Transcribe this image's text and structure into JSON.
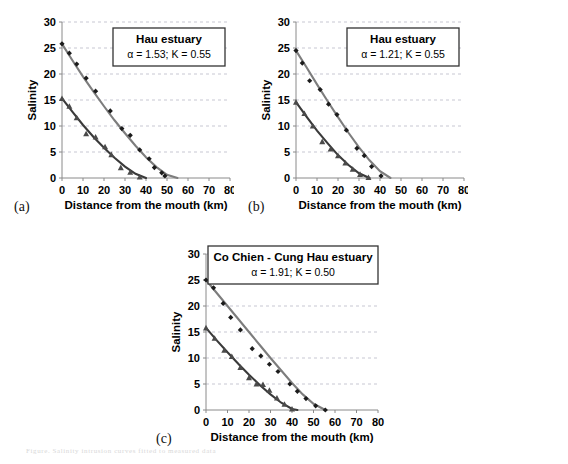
{
  "figure": {
    "background": "#ffffff",
    "caption_faint": "Figure. Salinity intrusion curves fitted to measured data",
    "colors": {
      "surface_curve": "#7d7d7d",
      "bottom_curve": "#3a3a3a",
      "grid": "#b9b9c6",
      "axis": "#8a8a8a",
      "marker_diamond": "#1c1c1c",
      "marker_triangle": "#4a4a4a"
    }
  },
  "panels": [
    {
      "letter": "(a)",
      "legend_title": "Hau estuary",
      "legend_sub": "α = 1.53; K = 0.55"
    },
    {
      "letter": "(b)",
      "legend_title": "Hau estuary",
      "legend_sub": "α = 1.21; K = 0.55"
    },
    {
      "letter": "(c)",
      "legend_title": "Co Chien - Cung Hau estuary",
      "legend_sub": "α = 1.91; K = 0.50"
    }
  ],
  "chart_data": [
    {
      "id": "panel-a",
      "type": "scatter",
      "title": "Hau estuary",
      "annotation": "α = 1.53; K = 0.55",
      "xlabel": "Distance from the mouth (km)",
      "ylabel": "Salinity",
      "xlim": [
        0,
        80
      ],
      "ylim": [
        0,
        30
      ],
      "xticks": [
        0,
        10,
        20,
        30,
        40,
        50,
        60,
        70,
        80
      ],
      "yticks": [
        0,
        5,
        10,
        15,
        20,
        25,
        30
      ],
      "grid": "horizontal-dashed",
      "legend_position": "top-right-box",
      "series": [
        {
          "name": "Surface salinity (measured)",
          "marker": "diamond",
          "color": "#1c1c1c",
          "x": [
            0,
            3.5,
            7,
            11.5,
            16,
            23,
            28.5,
            32.5,
            37,
            41.5,
            44,
            47.5,
            49
          ],
          "y": [
            25.8,
            24.0,
            21.9,
            19.2,
            16.7,
            12.9,
            9.5,
            8.2,
            5.4,
            3.7,
            2.0,
            1.0,
            0.4
          ]
        },
        {
          "name": "Surface salinity (fitted curve)",
          "type": "line",
          "color": "#7d7d7d",
          "x": [
            0,
            5,
            10,
            15,
            20,
            25,
            30,
            35,
            40,
            45,
            50,
            55
          ],
          "y": [
            25.8,
            22.6,
            19.5,
            16.6,
            13.8,
            11.1,
            8.6,
            6.2,
            4.0,
            2.1,
            0.6,
            0.0
          ]
        },
        {
          "name": "Bottom salinity (measured)",
          "marker": "triangle",
          "color": "#4a4a4a",
          "x": [
            0,
            3.5,
            7,
            11.5,
            16,
            20.5,
            23.5,
            28,
            32.5,
            37
          ],
          "y": [
            15.3,
            13.8,
            11.6,
            8.5,
            7.9,
            6.0,
            4.5,
            2.0,
            1.1,
            0.2
          ]
        },
        {
          "name": "Bottom salinity (fitted curve)",
          "type": "line",
          "color": "#3a3a3a",
          "x": [
            0,
            5,
            10,
            15,
            20,
            25,
            30,
            35,
            40
          ],
          "y": [
            15.3,
            12.7,
            10.2,
            7.9,
            5.8,
            3.9,
            2.2,
            0.8,
            0.0
          ]
        }
      ]
    },
    {
      "id": "panel-b",
      "type": "scatter",
      "title": "Hau estuary",
      "annotation": "α = 1.21; K = 0.55",
      "xlabel": "Distance from the mouth (km)",
      "ylabel": "Salinity",
      "xlim": [
        0,
        80
      ],
      "ylim": [
        0,
        30
      ],
      "xticks": [
        0,
        10,
        20,
        30,
        40,
        50,
        60,
        70,
        80
      ],
      "yticks": [
        0,
        5,
        10,
        15,
        20,
        25,
        30
      ],
      "grid": "horizontal-dashed",
      "legend_position": "top-right-box",
      "series": [
        {
          "name": "Surface salinity (measured)",
          "marker": "diamond",
          "color": "#1c1c1c",
          "x": [
            0,
            3,
            6.5,
            11.5,
            15.5,
            19.5,
            24,
            29,
            32.5,
            36,
            40.5
          ],
          "y": [
            24.5,
            22.1,
            18.7,
            17.0,
            14.2,
            12.2,
            9.2,
            5.7,
            4.3,
            2.2,
            0.4
          ]
        },
        {
          "name": "Surface salinity (fitted curve)",
          "type": "line",
          "color": "#7d7d7d",
          "x": [
            0,
            5,
            10,
            15,
            20,
            25,
            30,
            35,
            40,
            45
          ],
          "y": [
            24.5,
            21.3,
            18.0,
            14.8,
            11.7,
            8.7,
            5.9,
            3.4,
            1.3,
            0.0
          ]
        },
        {
          "name": "Bottom salinity (measured)",
          "marker": "triangle",
          "color": "#4a4a4a",
          "x": [
            0,
            4,
            8,
            12.5,
            16.5,
            20,
            23.5,
            27,
            30.5,
            34.5
          ],
          "y": [
            14.6,
            12.4,
            10.0,
            7.0,
            5.6,
            4.3,
            2.9,
            1.7,
            0.7,
            0.1
          ]
        },
        {
          "name": "Bottom salinity (fitted curve)",
          "type": "line",
          "color": "#3a3a3a",
          "x": [
            0,
            5,
            10,
            15,
            20,
            25,
            30,
            35
          ],
          "y": [
            14.6,
            11.8,
            9.1,
            6.7,
            4.4,
            2.5,
            0.9,
            0.0
          ]
        }
      ]
    },
    {
      "id": "panel-c",
      "type": "scatter",
      "title": "Co Chien - Cung Hau estuary",
      "annotation": "α = 1.91; K = 0.50",
      "xlabel": "Distance from the mouth (km)",
      "ylabel": "Salinity",
      "xlim": [
        0,
        80
      ],
      "ylim": [
        0,
        30
      ],
      "xticks": [
        0,
        10,
        20,
        30,
        40,
        50,
        60,
        70,
        80
      ],
      "yticks": [
        0,
        5,
        10,
        15,
        20,
        25,
        30
      ],
      "grid": "horizontal-dashed",
      "legend_position": "top-center-box",
      "series": [
        {
          "name": "Surface salinity (measured)",
          "marker": "diamond",
          "color": "#1c1c1c",
          "x": [
            0,
            3.5,
            8,
            11.5,
            16,
            21.5,
            25.5,
            29.5,
            33.5,
            39,
            42.5,
            46.5,
            51,
            55.5
          ],
          "y": [
            25.0,
            23.5,
            20.5,
            17.8,
            15.4,
            11.8,
            10.4,
            8.8,
            7.4,
            5.0,
            3.6,
            2.2,
            0.8,
            0.0
          ]
        },
        {
          "name": "Surface salinity (fitted curve)",
          "type": "line",
          "color": "#7d7d7d",
          "x": [
            0,
            5,
            10,
            15,
            20,
            25,
            30,
            35,
            40,
            45,
            50,
            55.5
          ],
          "y": [
            25.0,
            22.5,
            20.0,
            17.5,
            15.0,
            12.5,
            10.0,
            7.6,
            5.2,
            3.0,
            1.2,
            0.0
          ]
        },
        {
          "name": "Bottom salinity (measured)",
          "marker": "triangle",
          "color": "#4a4a4a",
          "x": [
            0,
            4,
            8.5,
            12,
            16,
            20,
            23.5,
            26.5,
            29.5,
            33,
            36.5,
            40
          ],
          "y": [
            15.8,
            13.8,
            11.5,
            10.3,
            8.2,
            6.2,
            5.0,
            4.9,
            3.8,
            2.3,
            1.1,
            0.2
          ]
        },
        {
          "name": "Bottom salinity (fitted curve)",
          "type": "line",
          "color": "#3a3a3a",
          "x": [
            0,
            5,
            10,
            15,
            20,
            25,
            30,
            35,
            40,
            42.5
          ],
          "y": [
            15.8,
            13.4,
            11.1,
            8.9,
            6.8,
            4.8,
            3.0,
            1.4,
            0.2,
            0.0
          ]
        }
      ]
    }
  ]
}
